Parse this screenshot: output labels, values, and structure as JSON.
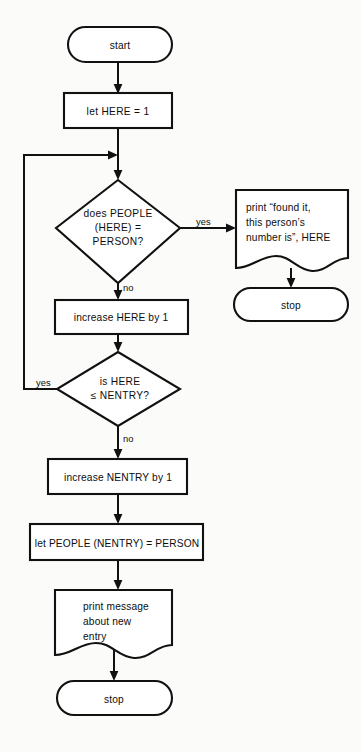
{
  "diagram": {
    "type": "flowchart",
    "colors": {
      "background": "#fbfbf9",
      "stroke": "#111111",
      "shape_fill": "#ffffff",
      "text": "#0d0d0d"
    },
    "nodes": [
      {
        "id": "start",
        "shape": "terminator",
        "lines": [
          "start"
        ]
      },
      {
        "id": "let-here",
        "shape": "process",
        "lines": [
          "let HERE = 1"
        ]
      },
      {
        "id": "check-people",
        "shape": "decision",
        "lines": [
          "does PEOPLE",
          "(HERE) =",
          "PERSON?"
        ]
      },
      {
        "id": "print-found",
        "shape": "document",
        "lines": [
          "print “found it,",
          "this person’s",
          "number is”, HERE"
        ]
      },
      {
        "id": "stop-found",
        "shape": "terminator",
        "lines": [
          "stop"
        ]
      },
      {
        "id": "increase-here",
        "shape": "process",
        "lines": [
          "increase HERE by 1"
        ]
      },
      {
        "id": "check-nentry",
        "shape": "decision",
        "lines": [
          "is HERE",
          "≤ NENTRY?"
        ]
      },
      {
        "id": "increase-nentry",
        "shape": "process",
        "lines": [
          "increase NENTRY by 1"
        ]
      },
      {
        "id": "let-people",
        "shape": "process",
        "lines": [
          "let PEOPLE (NENTRY) = PERSON"
        ]
      },
      {
        "id": "print-message",
        "shape": "document",
        "lines": [
          "print message",
          "about new",
          "entry"
        ]
      },
      {
        "id": "stop-new",
        "shape": "terminator",
        "lines": [
          "stop"
        ]
      }
    ],
    "edge_labels": {
      "people_yes": "yes",
      "people_no": "no",
      "nentry_yes": "yes",
      "nentry_no": "no"
    }
  }
}
